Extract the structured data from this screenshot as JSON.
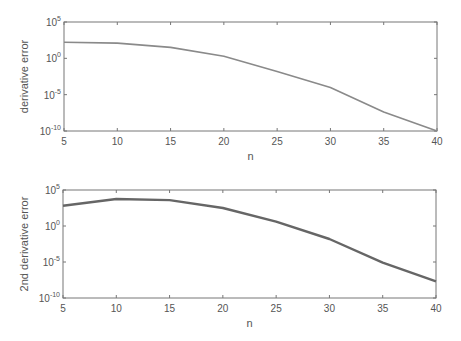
{
  "chart_data": [
    {
      "type": "line",
      "title": "",
      "xlabel": "n",
      "ylabel": "derivative error",
      "yscale": "log",
      "xlim": [
        5,
        40
      ],
      "ylim": [
        1e-10,
        100000.0
      ],
      "x_ticks": [
        5,
        10,
        15,
        20,
        25,
        30,
        35,
        40
      ],
      "y_ticks": [
        "10^-10",
        "10^-5",
        "10^0",
        "10^5"
      ],
      "y_tick_exponents": [
        -10,
        -5,
        0,
        5
      ],
      "grid": false,
      "line_color": "#8a8a8a",
      "line_width": 1.6,
      "series": [
        {
          "name": "derivative error",
          "x": [
            5,
            10,
            15,
            20,
            25,
            30,
            35,
            40
          ],
          "log10_values": [
            2.2,
            2.1,
            1.5,
            0.3,
            -1.8,
            -4.0,
            -7.4,
            -10.0
          ]
        }
      ]
    },
    {
      "type": "line",
      "title": "",
      "xlabel": "n",
      "ylabel": "2nd derivative error",
      "yscale": "log",
      "xlim": [
        5,
        40
      ],
      "ylim": [
        1e-10,
        100000.0
      ],
      "x_ticks": [
        5,
        10,
        15,
        20,
        25,
        30,
        35,
        40
      ],
      "y_ticks": [
        "10^-10",
        "10^-5",
        "10^0",
        "10^5"
      ],
      "y_tick_exponents": [
        -10,
        -5,
        0,
        5
      ],
      "grid": false,
      "line_color": "#666666",
      "line_width": 2.4,
      "series": [
        {
          "name": "2nd derivative error",
          "x": [
            5,
            10,
            15,
            20,
            25,
            30,
            35,
            40
          ],
          "log10_values": [
            2.8,
            3.75,
            3.6,
            2.5,
            0.6,
            -1.8,
            -5.1,
            -7.7
          ]
        }
      ]
    }
  ]
}
